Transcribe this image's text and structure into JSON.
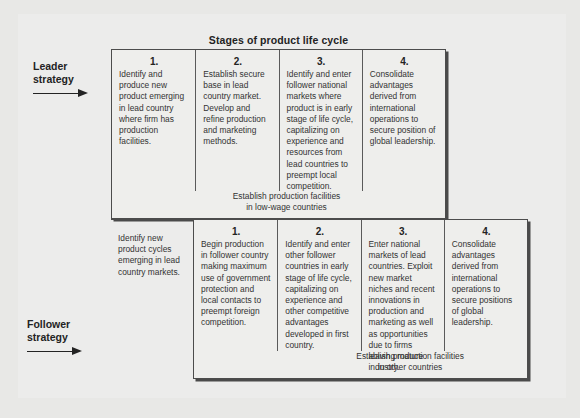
{
  "title": "Stages of product life cycle",
  "rows": {
    "leader": {
      "label_line1": "Leader",
      "label_line2": "strategy",
      "cells": [
        {
          "number": "1.",
          "text": "Identify and produce new product emerging in lead country where firm has production facilities."
        },
        {
          "number": "2.",
          "text": "Establish secure base in lead country market. Develop and refine production and marketing methods."
        },
        {
          "number": "3.",
          "text": "Identify and enter follower national markets where product is in early stage of life cycle, capitalizing on experience and resources from lead countries to preempt local competition."
        },
        {
          "number": "4.",
          "text": "Consolidate advantages derived from international operations to secure position of global leadership."
        }
      ],
      "footnote_line1": "Establish production facilities",
      "footnote_line2": "in low-wage countries"
    },
    "follower": {
      "label_line1": "Follower",
      "label_line2": "strategy",
      "intro": {
        "number": "",
        "text": "Identify new product cycles emerging in lead country markets."
      },
      "cells": [
        {
          "number": "1.",
          "text": "Begin production in follower country making maximum use of government protection and local contacts to preempt foreign competition."
        },
        {
          "number": "2.",
          "text": "Identify and enter other follower countries in early stage of life cycle, capitalizing on experience and other competitive advantages developed in first country."
        },
        {
          "number": "3.",
          "text": "Enter national markets of lead countries. Exploit new market niches and recent innovations in production and marketing as well as opportunities due to firms leaving mature industry."
        },
        {
          "number": "4.",
          "text": "Consolidate advantages derived from international operations to secure positions of global leadership."
        }
      ],
      "footnote_line1": "Establish production facilities",
      "footnote_line2": "in other countries"
    }
  },
  "colors": {
    "page_background": "#e8e8e6",
    "panel_background": "#ececeb",
    "box_border": "#4c4c4c",
    "text": "#333333",
    "heading": "#232323"
  }
}
